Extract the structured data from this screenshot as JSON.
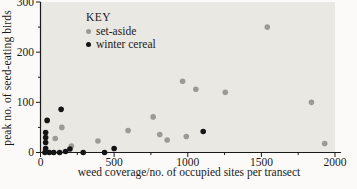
{
  "chart_data": {
    "type": "scatter",
    "title": "",
    "xlabel": "weed coverage/no. of occupied sites per transect",
    "ylabel": "peak no. of seed-eating birds",
    "xlim": [
      0,
      2000
    ],
    "ylim": [
      0,
      300
    ],
    "x_ticks": [
      0,
      500,
      1000,
      1500,
      2000
    ],
    "y_ticks": [
      0,
      100,
      200,
      300
    ],
    "x_minor_ticks": [
      250,
      750,
      1250,
      1750
    ],
    "y_minor_ticks": [
      50,
      150,
      250
    ],
    "grid": false,
    "plot_bg": "#eae8e3",
    "axis_color": "#1a1a1a",
    "legend": {
      "title": "KEY",
      "position": "top-left"
    },
    "series": [
      {
        "name": "set-aside",
        "color": "#9b9a97",
        "points": [
          [
            100,
            28
          ],
          [
            145,
            50
          ],
          [
            210,
            13
          ],
          [
            390,
            23
          ],
          [
            595,
            44
          ],
          [
            765,
            71
          ],
          [
            810,
            36
          ],
          [
            860,
            25
          ],
          [
            965,
            142
          ],
          [
            990,
            32
          ],
          [
            1055,
            126
          ],
          [
            1255,
            120
          ],
          [
            1540,
            250
          ],
          [
            1840,
            100
          ],
          [
            1930,
            18
          ]
        ]
      },
      {
        "name": "winter cereal",
        "color": "#141414",
        "points": [
          [
            30,
            0
          ],
          [
            60,
            0
          ],
          [
            90,
            0
          ],
          [
            130,
            0
          ],
          [
            170,
            2
          ],
          [
            200,
            7
          ],
          [
            290,
            0
          ],
          [
            435,
            0
          ],
          [
            500,
            8
          ],
          [
            35,
            8
          ],
          [
            35,
            20
          ],
          [
            35,
            30
          ],
          [
            35,
            40
          ],
          [
            45,
            64
          ],
          [
            140,
            86
          ],
          [
            1105,
            42
          ]
        ]
      }
    ]
  }
}
